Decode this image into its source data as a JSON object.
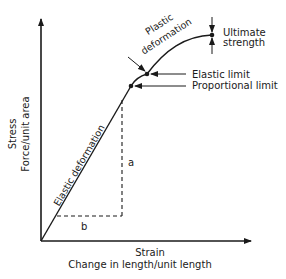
{
  "diagram": {
    "y_axis": {
      "label_line1": "Stress",
      "label_line2": "Force/unit area"
    },
    "x_axis": {
      "label_line1": "Strain",
      "label_line2": "Change in length/unit length"
    },
    "regions": {
      "elastic": "Elastic deformation",
      "plastic_line1": "Plastic",
      "plastic_line2": "deformation"
    },
    "points": {
      "proportional_limit": "Proportional limit",
      "elastic_limit": "Elastic limit",
      "ultimate_line1": "Ultimate",
      "ultimate_line2": "strength"
    },
    "slope_labels": {
      "rise": "a",
      "run": "b"
    },
    "colors": {
      "ink": "#1a1a1a",
      "background": "#ffffff"
    }
  }
}
